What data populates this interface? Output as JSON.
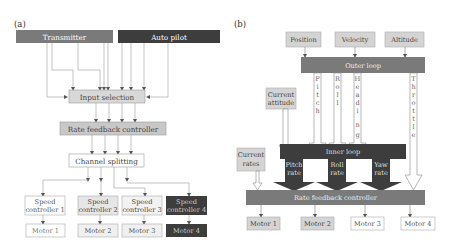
{
  "panel_a": {
    "label": "(a)",
    "transmitter": "Transmitter",
    "autopilot": "Auto pilot",
    "input_selection": "Input selection",
    "rate_feedback": "Rate feedback controller",
    "channel_splitting": "Channel splitting",
    "speed_controllers": [
      {
        "line1": "Speed",
        "line2": "controller 1"
      },
      {
        "line1": "Speed",
        "line2": "controller 2"
      },
      {
        "line1": "Speed",
        "line2": "controller 3"
      },
      {
        "line1": "Speed",
        "line2": "controller 4"
      }
    ],
    "motors": [
      "Motor 1",
      "Motor 2",
      "Motor 3",
      "Motor 4"
    ]
  },
  "panel_b": {
    "label": "(b)",
    "inputs": [
      "Position",
      "Velocity",
      "Altitude"
    ],
    "outer_loop": "Outer loop",
    "outer_outputs": [
      "P",
      "i",
      "t",
      "c",
      "h"
    ],
    "channels": {
      "pitch": "Pitch",
      "roll": "Roll",
      "heading": "Heading",
      "throttle": "Throttle"
    },
    "current_attitude": {
      "line1": "Current",
      "line2": "attitude"
    },
    "current_rates": {
      "line1": "Current",
      "line2": "rates"
    },
    "inner_loop": "Inner loop",
    "inner_outputs": [
      {
        "line1": "Pitch",
        "line2": "rate"
      },
      {
        "line1": "Roll",
        "line2": "rate"
      },
      {
        "line1": "Yaw",
        "line2": "rate"
      }
    ],
    "rate_feedback": "Rate feedback controller",
    "motors": [
      "Motor 1",
      "Motor 2",
      "Motor 3",
      "Motor 4"
    ]
  },
  "colors": {
    "dark": "#3d3d3d",
    "medium": "#7a7a7a",
    "light": "#d4d4d4",
    "white_box": "#ffffff",
    "border": "#9a9a9a",
    "line": "#8a8a8a"
  }
}
